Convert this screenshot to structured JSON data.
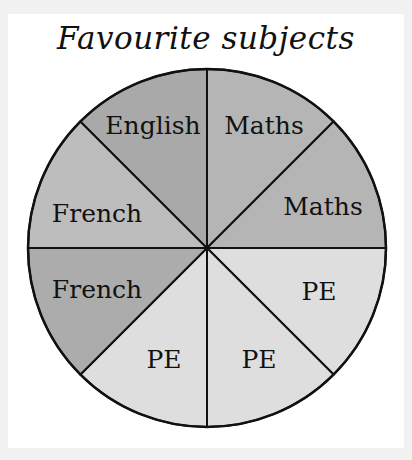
{
  "title": "Favourite subjects",
  "colors": {
    "page_background": "#f1f1f1",
    "card_background": "#ffffff",
    "outline": "#111111",
    "english": "#a9a9a9",
    "maths": "#b5b5b5",
    "pe": "#dedede",
    "french_upper": "#bdbdbd",
    "french_lower": "#acacac"
  },
  "chart_data": {
    "type": "pie",
    "title": "Favourite subjects",
    "slices_total": 8,
    "start_angle_deg": 0,
    "direction": "clockwise from 12 o'clock",
    "slices": [
      {
        "label": "Maths",
        "angle_start": 0,
        "angle_end": 45,
        "color": "#b5b5b5",
        "label_x": 264,
        "label_y": 134
      },
      {
        "label": "Maths",
        "angle_start": 45,
        "angle_end": 90,
        "color": "#b5b5b5",
        "label_x": 323,
        "label_y": 215
      },
      {
        "label": "PE",
        "angle_start": 90,
        "angle_end": 135,
        "color": "#dedede",
        "label_x": 319,
        "label_y": 300
      },
      {
        "label": "PE",
        "angle_start": 135,
        "angle_end": 180,
        "color": "#dedede",
        "label_x": 259,
        "label_y": 368
      },
      {
        "label": "PE",
        "angle_start": 180,
        "angle_end": 225,
        "color": "#dedede",
        "label_x": 164,
        "label_y": 368
      },
      {
        "label": "French",
        "angle_start": 225,
        "angle_end": 270,
        "color": "#acacac",
        "label_x": 97,
        "label_y": 298
      },
      {
        "label": "French",
        "angle_start": 270,
        "angle_end": 315,
        "color": "#bdbdbd",
        "label_x": 97,
        "label_y": 222
      },
      {
        "label": "English",
        "angle_start": 315,
        "angle_end": 360,
        "color": "#a9a9a9",
        "label_x": 153,
        "label_y": 134
      }
    ],
    "summary": [
      {
        "subject": "Maths",
        "slices": 2,
        "fraction": 0.25
      },
      {
        "subject": "PE",
        "slices": 3,
        "fraction": 0.375
      },
      {
        "subject": "French",
        "slices": 2,
        "fraction": 0.25
      },
      {
        "subject": "English",
        "slices": 1,
        "fraction": 0.125
      }
    ],
    "center": [
      207,
      248
    ],
    "radius": 179
  }
}
